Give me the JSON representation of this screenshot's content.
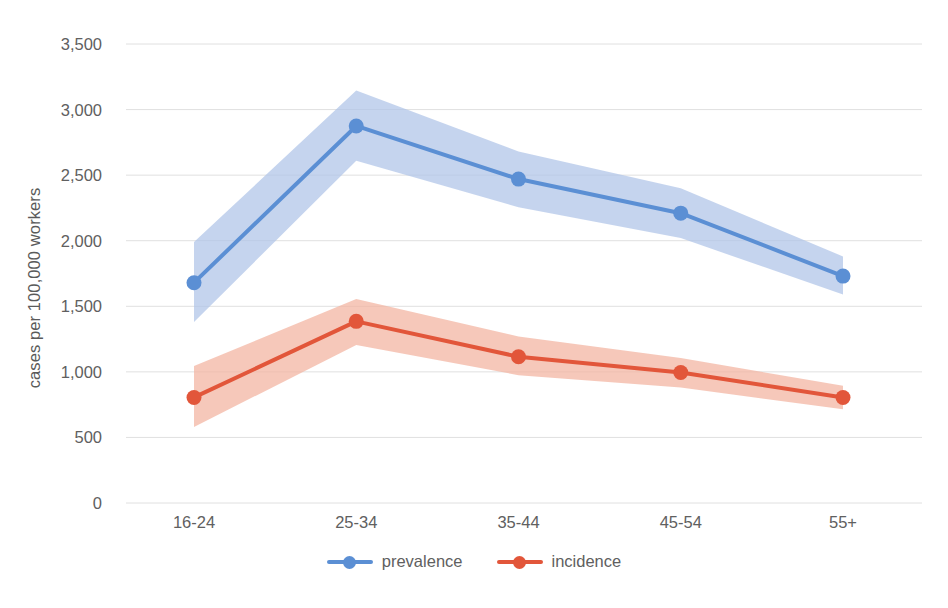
{
  "chart_data": {
    "type": "line",
    "title": "",
    "xlabel": "",
    "ylabel": "cases per 100,000 workers",
    "categories": [
      "16-24",
      "25-34",
      "35-44",
      "45-54",
      "55+"
    ],
    "ylim": [
      0,
      3500
    ],
    "ytick_values": [
      0,
      500,
      1000,
      1500,
      2000,
      2500,
      3000,
      3500
    ],
    "ytick_labels": [
      "0",
      "500",
      "1,000",
      "1,500",
      "2,000",
      "2,500",
      "3,000",
      "3,500"
    ],
    "grid": true,
    "legend_position": "bottom",
    "series": [
      {
        "name": "prevalence",
        "color": "#5b8fd4",
        "band_color": "#aec3e8",
        "values": [
          1680,
          2875,
          2470,
          2210,
          1730
        ],
        "band_lower": [
          1380,
          2610,
          2255,
          2020,
          1590
        ],
        "band_upper": [
          1990,
          3145,
          2680,
          2400,
          1880
        ]
      },
      {
        "name": "incidence",
        "color": "#e2563a",
        "band_color": "#f3b3a0",
        "values": [
          805,
          1385,
          1115,
          995,
          805
        ],
        "band_lower": [
          580,
          1205,
          975,
          880,
          715
        ],
        "band_upper": [
          1045,
          1555,
          1270,
          1105,
          895
        ]
      }
    ]
  },
  "legend": {
    "items": [
      {
        "label": "prevalence",
        "icon": "line-marker-icon"
      },
      {
        "label": "incidence",
        "icon": "line-marker-icon"
      }
    ]
  },
  "colors": {
    "prevalence": "#5b8fd4",
    "prevalence_band": "#aec3e8",
    "incidence": "#e2563a",
    "incidence_band": "#f3b3a0",
    "grid": "#e0e0e0",
    "text": "#606060"
  }
}
